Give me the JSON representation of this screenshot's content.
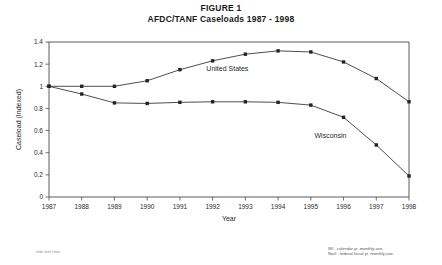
{
  "title": {
    "line1": "FIGURE 1",
    "line2": "AFDC/TANF Caseloads 1987 - 1998"
  },
  "footnotes": {
    "line1": "WI - calendar yr. monthly ave.",
    "line2": "Nat'l - federal fiscal yr. monthly ave."
  },
  "source_note": "afdc-tanf.chart",
  "chart_data": {
    "type": "line",
    "title": "AFDC/TANF Caseloads 1987 - 1998",
    "xlabel": "Year",
    "ylabel": "Caseload (Indexed)",
    "categories": [
      1987,
      1988,
      1989,
      1990,
      1991,
      1992,
      1993,
      1994,
      1995,
      1996,
      1997,
      1998
    ],
    "xtick_labels": [
      "1987",
      "1988",
      "1989",
      "1990",
      "1991",
      "1992",
      "1993",
      "1994",
      "1995",
      "1996",
      "1997",
      "1998"
    ],
    "ytick_labels": [
      "0",
      "0.2",
      "0.4",
      "0.6",
      "0.8",
      "1",
      "1.2",
      "1.4"
    ],
    "yticks": [
      0,
      0.2,
      0.4,
      0.6,
      0.8,
      1.0,
      1.2,
      1.4
    ],
    "ylim": [
      0,
      1.4
    ],
    "grid": false,
    "legend": "inline-annotations",
    "marker": "square",
    "series": [
      {
        "name": "United States",
        "label": "United States",
        "label_x": 1992.45,
        "label_y": 1.14,
        "values": [
          1.0,
          1.0,
          1.0,
          1.05,
          1.15,
          1.23,
          1.29,
          1.32,
          1.31,
          1.22,
          1.07,
          0.86
        ]
      },
      {
        "name": "Wisconsin",
        "label": "Wisconsin",
        "label_x": 1995.6,
        "label_y": 0.53,
        "values": [
          1.0,
          0.93,
          0.85,
          0.845,
          0.855,
          0.86,
          0.86,
          0.855,
          0.83,
          0.72,
          0.47,
          0.19
        ]
      }
    ]
  }
}
